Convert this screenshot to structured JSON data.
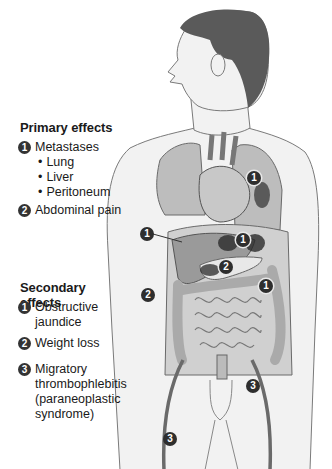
{
  "primary": {
    "heading": "Primary effects",
    "items": [
      {
        "num": "1",
        "label": "Metastases",
        "subitems": [
          "Lung",
          "Liver",
          "Peritoneum"
        ]
      },
      {
        "num": "2",
        "label": "Abdominal pain"
      }
    ]
  },
  "secondary": {
    "heading": "Secondary effects",
    "items": [
      {
        "num": "1",
        "label_lines": [
          "Obstructive",
          "jaundice"
        ]
      },
      {
        "num": "2",
        "label_lines": [
          "Weight loss"
        ]
      },
      {
        "num": "3",
        "label_lines": [
          "Migratory",
          "thrombophlebitis",
          "(paraneoplastic",
          "syndrome)"
        ]
      }
    ]
  },
  "figure_markers": [
    {
      "num": "1",
      "location": "lung"
    },
    {
      "num": "1",
      "location": "liver"
    },
    {
      "num": "1",
      "location": "upper-abdomen"
    },
    {
      "num": "1",
      "location": "peritoneum"
    },
    {
      "num": "2",
      "location": "pancreas"
    },
    {
      "num": "2",
      "location": "flank"
    },
    {
      "num": "3",
      "location": "right-leg-vein"
    },
    {
      "num": "3",
      "location": "left-leg-vein"
    }
  ],
  "colors": {
    "skin": "#f2f2f2",
    "outline": "#7a7a7a",
    "hair": "#5a5a5a",
    "organ": "#9a9a9a",
    "lesion": "#2a2a2a",
    "marker": "#2e2e2e"
  }
}
